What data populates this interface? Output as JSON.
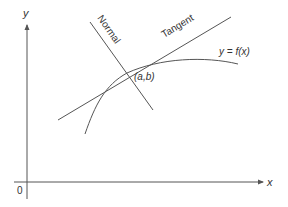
{
  "diagram": {
    "title": "",
    "axes": {
      "x_label": "x",
      "y_label": "y",
      "origin_label": "0"
    },
    "curve_label": "y = f(x)",
    "point_label": "(a,b)",
    "tangent_label": "Tangent",
    "normal_label": "Normal",
    "colors": {
      "line": "#555555",
      "text": "#333333",
      "background": "#ffffff"
    }
  }
}
